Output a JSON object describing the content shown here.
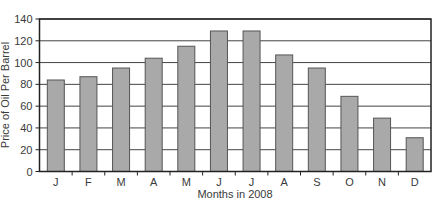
{
  "chart_data": {
    "type": "bar",
    "title": "",
    "xlabel": "Months in 2008",
    "ylabel": "Price of Oil Per Barrel",
    "categories": [
      "J",
      "F",
      "M",
      "A",
      "M",
      "J",
      "J",
      "A",
      "S",
      "O",
      "N",
      "D"
    ],
    "values": [
      84,
      87,
      95,
      104,
      115,
      129,
      129,
      107,
      95,
      69,
      49,
      31
    ],
    "ylim": [
      0,
      140
    ],
    "yticks": [
      0,
      20,
      40,
      60,
      80,
      100,
      120,
      140
    ],
    "grid": true,
    "legend": null,
    "colors": {
      "bar_fill": "#a9a9a9",
      "bar_stroke": "#555555",
      "grid": "#444444"
    }
  }
}
